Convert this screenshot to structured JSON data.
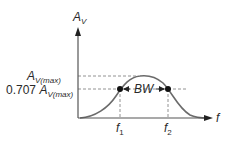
{
  "diagram": {
    "y_axis": {
      "symbol": "A",
      "subscript": "V"
    },
    "x_axis": {
      "symbol": "f"
    },
    "levels": [
      {
        "id": "max",
        "prefix": "",
        "symbol": "A",
        "subscript": "V(max)"
      },
      {
        "id": "cutoff",
        "prefix": "0.707 ",
        "symbol": "A",
        "subscript": "V(max)"
      }
    ],
    "markers": [
      {
        "id": "f1",
        "symbol": "f",
        "subscript": "1"
      },
      {
        "id": "f2",
        "symbol": "f",
        "subscript": "2"
      }
    ],
    "bandwidth_label": "BW",
    "colors": {
      "curve": "#6b6b6b",
      "axis": "#555555",
      "dash": "#777777",
      "dot": "#111111",
      "text": "#2a2a2a"
    }
  }
}
